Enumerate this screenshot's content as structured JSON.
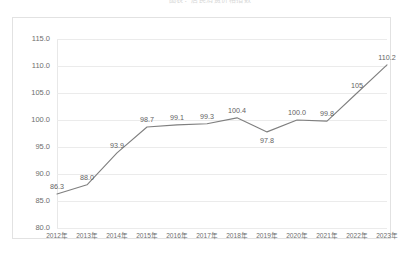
{
  "top_caption": "图表：居民消费价格指数",
  "chart_data": {
    "type": "line",
    "title": "",
    "subtitle": "",
    "xlabel": "",
    "ylabel": "",
    "categories": [
      "2012年",
      "2013年",
      "2014年",
      "2015年",
      "2016年",
      "2017年",
      "2018年",
      "2019年",
      "2020年",
      "2021年",
      "2022年",
      "2023年"
    ],
    "values": [
      86.3,
      88.0,
      93.9,
      98.7,
      99.1,
      99.3,
      100.4,
      97.8,
      100.0,
      99.8,
      105.0,
      110.2
    ],
    "data_labels": [
      "86.3",
      "88.0",
      "93.9",
      "98.7",
      "99.1",
      "99.3",
      "100.4",
      "97.8",
      "100.0",
      "99.8",
      "105",
      "110.2"
    ],
    "label_positions": [
      "above",
      "above",
      "above",
      "above",
      "above",
      "above",
      "above",
      "below",
      "above",
      "above",
      "above",
      "above"
    ],
    "ylim": [
      80.0,
      115.0
    ],
    "ytick_values": [
      80.0,
      85.0,
      90.0,
      95.0,
      100.0,
      105.0,
      110.0,
      115.0
    ],
    "ytick_labels": [
      "80.0",
      "85.0",
      "90.0",
      "95.0",
      "100.0",
      "105.0",
      "110.0",
      "115.0"
    ],
    "grid": true,
    "legend": false,
    "legend_position": "none",
    "series": [
      {
        "name": "",
        "color": "#7f7f7f",
        "values": [
          86.3,
          88.0,
          93.9,
          98.7,
          99.1,
          99.3,
          100.4,
          97.8,
          100.0,
          99.8,
          105.0,
          110.2
        ]
      }
    ]
  },
  "colors": {
    "line": "#7f7f7f",
    "grid": "#ebebeb",
    "frame": "#e2e2e2",
    "tick_text": "#6e6e6e",
    "label_text": "#636363",
    "background": "#ffffff"
  }
}
